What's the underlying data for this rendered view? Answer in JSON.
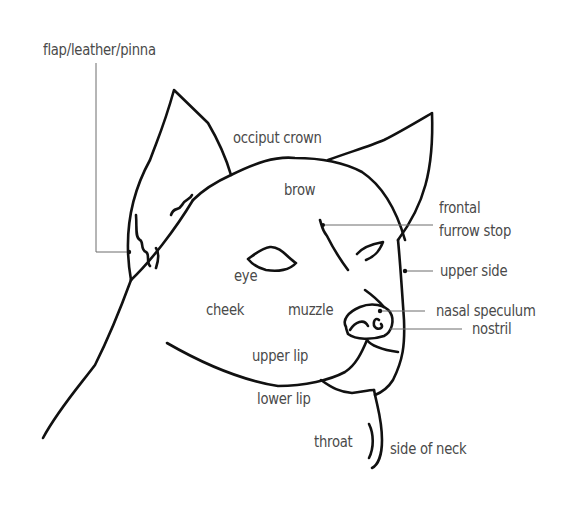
{
  "diagram": {
    "type": "labeled-anatomy-illustration",
    "colors": {
      "background": "#ffffff",
      "line_art": "#111111",
      "label_text": "#4a4a4a",
      "leader_line": "#6d6d6d"
    },
    "labels": {
      "flap": "flap/leather/pinna",
      "occiput": "occiput crown",
      "brow": "brow",
      "frontal_1": "frontal",
      "frontal_2": "furrow stop",
      "upper_side": "upper side",
      "eye": "eye",
      "cheek": "cheek",
      "muzzle": "muzzle",
      "nasal_speculum": "nasal speculum",
      "nostril": "nostril",
      "upper_lip": "upper lip",
      "lower_lip": "lower lip",
      "throat": "throat",
      "side_of_neck": "side of neck"
    }
  }
}
